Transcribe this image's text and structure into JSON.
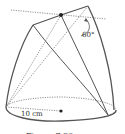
{
  "figure": {
    "angle_label": "60°",
    "radius_label": "10 cm",
    "caption": "Figure 7.80",
    "colors": {
      "solid": "#555555",
      "dotted": "#777777",
      "text": "#333333"
    }
  }
}
